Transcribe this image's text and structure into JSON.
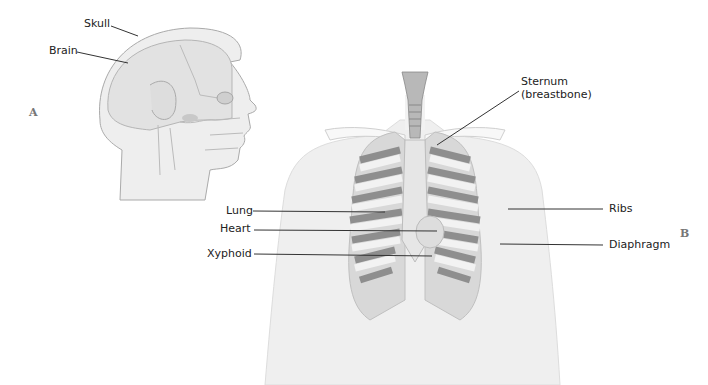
{
  "figure": {
    "panels": [
      {
        "id": "A",
        "subject": "head-lateral-view"
      },
      {
        "id": "B",
        "subject": "thorax-anterior-view"
      }
    ],
    "labels": {
      "skull": "Skull",
      "brain": "Brain",
      "sternum_line1": "Sternum",
      "sternum_line2": "(breastbone)",
      "lung": "Lung",
      "heart": "Heart",
      "xyphoid": "Xyphoid",
      "ribs": "Ribs",
      "diaphragm": "Diaphragm"
    },
    "colors": {
      "background": "#ffffff",
      "skin": "#ececec",
      "bone": "#f5f5f5",
      "rib_shadow": "#8a8a8a",
      "leader_line": "#333333"
    }
  }
}
